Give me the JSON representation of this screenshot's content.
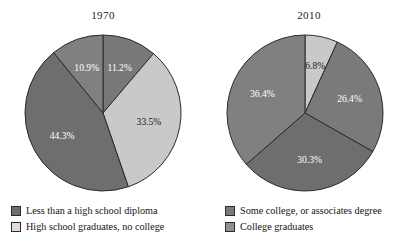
{
  "figure": {
    "background": "#ffffff",
    "palette": {
      "dark_gray": "#6e6e6e",
      "mid_dark_gray": "#787878",
      "mid_gray": "#808080",
      "light_gray": "#c9c9c9",
      "outline": "#2b2b2b",
      "label_light": "#ffffff",
      "label_dark": "#1a1a1a"
    }
  },
  "charts": [
    {
      "title": "1970",
      "center": {
        "x": 103,
        "y": 83
      },
      "radius": 78,
      "slices": [
        {
          "label": "11.2%",
          "value": 11.2,
          "category": "High school graduates, no college",
          "color": "#787878",
          "label_color": "light"
        },
        {
          "label": "33.5%",
          "value": 33.5,
          "category": "Some college, or associates degree",
          "color": "#c9c9c9",
          "label_color": "dark"
        },
        {
          "label": "44.3%",
          "value": 44.3,
          "category": "Less than a high school diploma",
          "color": "#6e6e6e",
          "label_color": "light"
        },
        {
          "label": "10.9%",
          "value": 10.9,
          "category": "College graduates",
          "color": "#808080",
          "label_color": "light"
        }
      ]
    },
    {
      "title": "2010",
      "center": {
        "x": 99,
        "y": 83
      },
      "radius": 78,
      "slices": [
        {
          "label": "6.8%",
          "value": 6.8,
          "category": "Less than a high school diploma",
          "color": "#c9c9c9",
          "label_color": "dark"
        },
        {
          "label": "26.4%",
          "value": 26.4,
          "category": "High school graduates, no college",
          "color": "#7a7a7a",
          "label_color": "light"
        },
        {
          "label": "30.3%",
          "value": 30.3,
          "category": "Some college, or associates degree",
          "color": "#6e6e6e",
          "label_color": "light"
        },
        {
          "label": "36.4%",
          "value": 36.4,
          "category": "College graduates",
          "color": "#808080",
          "label_color": "light"
        }
      ]
    }
  ],
  "legend": {
    "left_column": [
      {
        "label": "Less than a high school diploma",
        "color": "#6e6e6e"
      },
      {
        "label": "High school graduates, no college",
        "color": "#dcdcdc"
      }
    ],
    "right_column": [
      {
        "label": "Some college, or associates degree",
        "color": "#7a7a7a"
      },
      {
        "label": "College graduates",
        "color": "#909090"
      }
    ]
  },
  "chart_data": [
    {
      "type": "pie",
      "title": "1970",
      "categories": [
        "High school graduates, no college",
        "Some college, or associates degree",
        "Less than a high school diploma",
        "College graduates"
      ],
      "values": [
        11.2,
        33.5,
        44.3,
        10.9
      ],
      "data_labels": [
        "11.2%",
        "33.5%",
        "44.3%",
        "10.9%"
      ],
      "units": "percent",
      "start_angle_deg": 0,
      "direction": "clockwise",
      "legend_position": "bottom",
      "grid": false
    },
    {
      "type": "pie",
      "title": "2010",
      "categories": [
        "Less than a high school diploma",
        "High school graduates, no college",
        "Some college, or associates degree",
        "College graduates"
      ],
      "values": [
        6.8,
        26.4,
        30.3,
        36.4
      ],
      "data_labels": [
        "6.8%",
        "26.4%",
        "30.3%",
        "36.4%"
      ],
      "units": "percent",
      "start_angle_deg": 0,
      "direction": "clockwise",
      "legend_position": "bottom",
      "grid": false
    }
  ]
}
